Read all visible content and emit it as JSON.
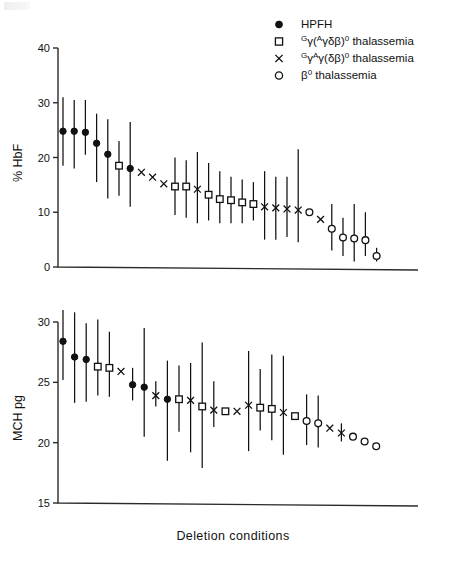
{
  "figure": {
    "xlabel": "Deletion  conditions",
    "legend": [
      {
        "marker": "filled-circle",
        "label": "HPFH",
        "html": "HPFH"
      },
      {
        "marker": "open-square",
        "label": "Gγ(Aγδβ)0 thalassemia",
        "html": "<tspan class='legsup' baseline-shift='super'>G</tspan>γ(<tspan class='legsup' baseline-shift='super'>A</tspan>γδβ)<tspan class='legsup' baseline-shift='super'>0</tspan> thalassemia"
      },
      {
        "marker": "cross-x",
        "label": "GγAγ(δβ)0 thalassemia",
        "html": "<tspan class='legsup' baseline-shift='super'>G</tspan>γ<tspan class='legsup' baseline-shift='super'>A</tspan>γ(δβ)<tspan class='legsup' baseline-shift='super'>0</tspan> thalassemia"
      },
      {
        "marker": "open-circle",
        "label": "β0 thalassemia",
        "html": "β<tspan class='legsup' baseline-shift='super'>0</tspan> thalassemia"
      }
    ]
  },
  "chart_data": [
    {
      "type": "scatter",
      "title": "",
      "xlabel": "Deletion conditions",
      "ylabel": "% HbF",
      "ylim": [
        0,
        40
      ],
      "yticks": [
        0,
        10,
        20,
        30,
        40
      ],
      "grid": false,
      "legend_position": "top-right",
      "error_bars": "vertical range",
      "points": [
        {
          "i": 1,
          "marker": "filled-circle",
          "y": 24.8,
          "lo": 18.5,
          "hi": 31.0
        },
        {
          "i": 2,
          "marker": "filled-circle",
          "y": 24.8,
          "lo": 18.0,
          "hi": 30.5
        },
        {
          "i": 3,
          "marker": "filled-circle",
          "y": 24.6,
          "lo": 20.5,
          "hi": 30.5
        },
        {
          "i": 4,
          "marker": "filled-circle",
          "y": 22.6,
          "lo": 15.5,
          "hi": 28.0
        },
        {
          "i": 5,
          "marker": "filled-circle",
          "y": 20.6,
          "lo": 12.5,
          "hi": 27.0
        },
        {
          "i": 6,
          "marker": "open-square",
          "y": 18.5,
          "lo": 13.0,
          "hi": 23.0
        },
        {
          "i": 7,
          "marker": "filled-circle",
          "y": 18.0,
          "lo": 11.0,
          "hi": 26.5
        },
        {
          "i": 8,
          "marker": "cross-x",
          "y": 17.3,
          "lo": null,
          "hi": null
        },
        {
          "i": 9,
          "marker": "cross-x",
          "y": 16.4,
          "lo": null,
          "hi": null
        },
        {
          "i": 10,
          "marker": "cross-x",
          "y": 15.2,
          "lo": null,
          "hi": null
        },
        {
          "i": 11,
          "marker": "open-square",
          "y": 14.7,
          "lo": 9.5,
          "hi": 20.0
        },
        {
          "i": 12,
          "marker": "open-square",
          "y": 14.7,
          "lo": 9.0,
          "hi": 19.5
        },
        {
          "i": 13,
          "marker": "cross-x",
          "y": 14.2,
          "lo": 8.0,
          "hi": 21.0
        },
        {
          "i": 14,
          "marker": "open-square",
          "y": 13.2,
          "lo": 8.5,
          "hi": 19.0
        },
        {
          "i": 15,
          "marker": "open-square",
          "y": 12.4,
          "lo": 8.0,
          "hi": 17.5
        },
        {
          "i": 16,
          "marker": "open-square",
          "y": 12.2,
          "lo": 8.0,
          "hi": 16.5
        },
        {
          "i": 17,
          "marker": "open-square",
          "y": 11.8,
          "lo": 8.0,
          "hi": 16.0
        },
        {
          "i": 18,
          "marker": "open-square",
          "y": 11.5,
          "lo": 8.5,
          "hi": 15.5
        },
        {
          "i": 19,
          "marker": "cross-x",
          "y": 11.0,
          "lo": 5.0,
          "hi": 17.5
        },
        {
          "i": 20,
          "marker": "cross-x",
          "y": 10.8,
          "lo": 5.0,
          "hi": 16.5
        },
        {
          "i": 21,
          "marker": "cross-x",
          "y": 10.6,
          "lo": 5.5,
          "hi": 16.5
        },
        {
          "i": 22,
          "marker": "cross-x",
          "y": 10.4,
          "lo": 4.5,
          "hi": 21.5
        },
        {
          "i": 23,
          "marker": "open-circle",
          "y": 10.0,
          "lo": null,
          "hi": null
        },
        {
          "i": 24,
          "marker": "cross-x",
          "y": 8.7,
          "lo": null,
          "hi": null
        },
        {
          "i": 25,
          "marker": "open-circle",
          "y": 7.0,
          "lo": 3.0,
          "hi": 11.5
        },
        {
          "i": 26,
          "marker": "open-circle",
          "y": 5.4,
          "lo": 2.0,
          "hi": 9.0
        },
        {
          "i": 27,
          "marker": "open-circle",
          "y": 5.2,
          "lo": 1.0,
          "hi": 11.5
        },
        {
          "i": 28,
          "marker": "open-circle",
          "y": 4.9,
          "lo": 2.0,
          "hi": 10.0
        },
        {
          "i": 29,
          "marker": "open-circle",
          "y": 2.0,
          "lo": 1.0,
          "hi": 3.5
        }
      ]
    },
    {
      "type": "scatter",
      "title": "",
      "xlabel": "Deletion conditions",
      "ylabel": "MCH  pg",
      "ylim": [
        15,
        30
      ],
      "yticks": [
        15,
        20,
        25,
        30
      ],
      "grid": false,
      "legend_position": "none",
      "error_bars": "vertical range",
      "points": [
        {
          "i": 1,
          "marker": "filled-circle",
          "y": 28.4,
          "lo": 25.2,
          "hi": 31.0
        },
        {
          "i": 2,
          "marker": "filled-circle",
          "y": 27.1,
          "lo": 23.3,
          "hi": 30.8
        },
        {
          "i": 3,
          "marker": "filled-circle",
          "y": 26.9,
          "lo": 23.4,
          "hi": 29.9
        },
        {
          "i": 4,
          "marker": "open-square",
          "y": 26.3,
          "lo": 23.9,
          "hi": 30.2
        },
        {
          "i": 5,
          "marker": "open-square",
          "y": 26.2,
          "lo": 23.8,
          "hi": 29.2
        },
        {
          "i": 6,
          "marker": "cross-x",
          "y": 25.9,
          "lo": null,
          "hi": null
        },
        {
          "i": 7,
          "marker": "filled-circle",
          "y": 24.8,
          "lo": 23.5,
          "hi": 26.2
        },
        {
          "i": 8,
          "marker": "filled-circle",
          "y": 24.6,
          "lo": 20.5,
          "hi": 29.5
        },
        {
          "i": 9,
          "marker": "cross-x",
          "y": 23.9,
          "lo": 23.0,
          "hi": 25.1
        },
        {
          "i": 10,
          "marker": "filled-circle",
          "y": 23.6,
          "lo": 18.5,
          "hi": 26.8
        },
        {
          "i": 11,
          "marker": "open-square",
          "y": 23.6,
          "lo": 20.9,
          "hi": 26.4
        },
        {
          "i": 12,
          "marker": "cross-x",
          "y": 23.5,
          "lo": 19.2,
          "hi": 26.6
        },
        {
          "i": 13,
          "marker": "open-square",
          "y": 23.0,
          "lo": 17.9,
          "hi": 28.3
        },
        {
          "i": 14,
          "marker": "cross-x",
          "y": 22.7,
          "lo": 21.3,
          "hi": 25.1
        },
        {
          "i": 15,
          "marker": "open-square",
          "y": 22.6,
          "lo": null,
          "hi": null
        },
        {
          "i": 16,
          "marker": "cross-x",
          "y": 22.6,
          "lo": null,
          "hi": null
        },
        {
          "i": 17,
          "marker": "cross-x",
          "y": 23.1,
          "lo": 19.3,
          "hi": 27.6
        },
        {
          "i": 18,
          "marker": "open-square",
          "y": 22.9,
          "lo": 21.0,
          "hi": 26.1
        },
        {
          "i": 19,
          "marker": "open-square",
          "y": 22.8,
          "lo": 20.2,
          "hi": 27.3
        },
        {
          "i": 20,
          "marker": "cross-x",
          "y": 22.5,
          "lo": 19.0,
          "hi": 27.2
        },
        {
          "i": 21,
          "marker": "open-square",
          "y": 22.2,
          "lo": null,
          "hi": null
        },
        {
          "i": 22,
          "marker": "open-circle",
          "y": 21.8,
          "lo": 19.8,
          "hi": 24.0
        },
        {
          "i": 23,
          "marker": "open-circle",
          "y": 21.6,
          "lo": 19.6,
          "hi": 23.9
        },
        {
          "i": 24,
          "marker": "cross-x",
          "y": 21.2,
          "lo": null,
          "hi": null
        },
        {
          "i": 25,
          "marker": "cross-x",
          "y": 20.8,
          "lo": 20.1,
          "hi": 21.6
        },
        {
          "i": 26,
          "marker": "open-circle",
          "y": 20.5,
          "lo": null,
          "hi": null
        },
        {
          "i": 27,
          "marker": "open-circle",
          "y": 20.1,
          "lo": null,
          "hi": null
        },
        {
          "i": 28,
          "marker": "open-circle",
          "y": 19.7,
          "lo": null,
          "hi": null
        }
      ]
    }
  ]
}
